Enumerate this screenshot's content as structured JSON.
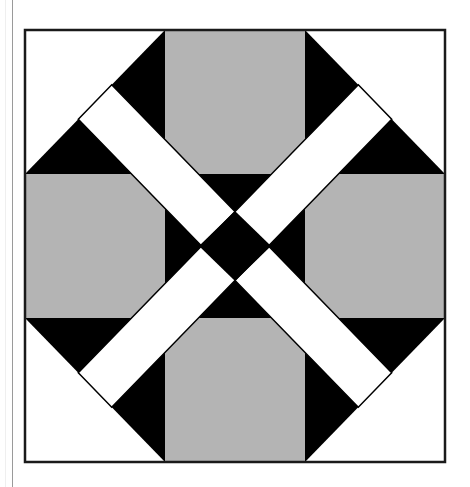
{
  "title": "Quilt block: octagonal frame with crossed diagonal strips",
  "colors": {
    "background": "#ffffff",
    "black": "#000000",
    "gray": "#b4b4b4",
    "white": "#ffffff",
    "border": "#1a1a1a",
    "page_edge": "#9a9a9a"
  },
  "block": {
    "grid": "3x3",
    "bounds": {
      "x": 25,
      "y": 30,
      "width": 420,
      "height": 432
    },
    "cells": {
      "corners": "white with black triangle toward center",
      "edges": "gray squares (top, left, right, bottom)",
      "center": "black square"
    },
    "strips": {
      "count": 2,
      "color": "white",
      "width": 48,
      "directions": [
        "top-left to bottom-right",
        "top-right to bottom-left"
      ]
    },
    "center_motif": "black diamond formed at strip crossing"
  }
}
